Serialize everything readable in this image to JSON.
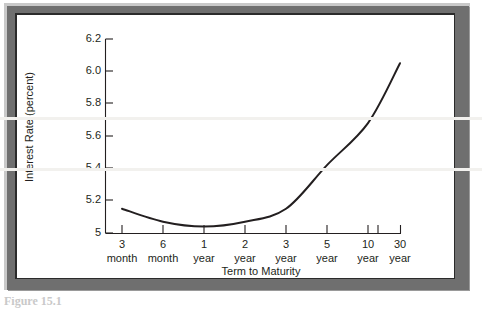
{
  "figure": {
    "caption": "Figure 15.1",
    "frame_color": "#6f6f6f",
    "canvas_color": "#ffffff",
    "ink_color": "#231f20"
  },
  "chart_data": {
    "type": "line",
    "title": "",
    "xlabel": "Term to Maturity",
    "ylabel": "Interest Rate (percent)",
    "grid": false,
    "legend": "none",
    "categories": [
      "3 month",
      "6 month",
      "1 year",
      "2 year",
      "3 year",
      "5 year",
      "10 year",
      "30 year"
    ],
    "x_tick_numbers": [
      "3",
      "6",
      "1",
      "2",
      "3",
      "5",
      "10",
      "30"
    ],
    "x_tick_units": [
      "month",
      "month",
      "year",
      "year",
      "year",
      "year",
      "year",
      "year"
    ],
    "values": [
      5.15,
      5.07,
      5.04,
      5.07,
      5.15,
      5.42,
      5.68,
      6.05
    ],
    "series": [
      {
        "name": "Yield Curve",
        "values": [
          5.15,
          5.07,
          5.04,
          5.07,
          5.15,
          5.42,
          5.68,
          6.05
        ]
      }
    ],
    "y_ticks": [
      "5",
      "5.2",
      "5.4",
      "5.6",
      "5.8",
      "6.0",
      "6.2"
    ],
    "y_tick_values": [
      5.0,
      5.2,
      5.4,
      5.6,
      5.8,
      6.0,
      6.2
    ],
    "ylim": [
      5.0,
      6.2
    ],
    "xlim": [
      0,
      7
    ]
  }
}
